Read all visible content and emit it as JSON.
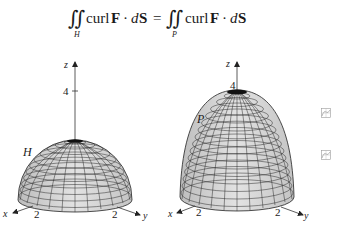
{
  "equation": {
    "lhs_integral": "∬",
    "lhs_subscript": "H",
    "lhs_curl": "curl",
    "lhs_F": "F",
    "lhs_dot": "·",
    "lhs_d": "d",
    "lhs_S": "S",
    "equals": "=",
    "rhs_integral": "∬",
    "rhs_subscript": "P",
    "rhs_curl": "curl",
    "rhs_F": "F",
    "rhs_dot": "·",
    "rhs_d": "d",
    "rhs_S": "S"
  },
  "figures": [
    {
      "surface": "hemisphere",
      "label": "H",
      "z_axis_label": "z",
      "z_tick": "4",
      "x_axis_label": "x",
      "x_tick": "2",
      "y_axis_label": "y",
      "y_tick": "2"
    },
    {
      "surface": "paraboloid",
      "label": "P",
      "z_axis_label": "z",
      "z_tick": "4",
      "x_axis_label": "x",
      "x_tick": "2",
      "y_axis_label": "y",
      "y_tick": "2"
    }
  ],
  "side_icons": [
    "graph-icon",
    "graph-icon"
  ],
  "colors": {
    "surface_fill": "#d4d4d4",
    "mesh_line": "#2a2a2a",
    "axis": "#333333",
    "icon_stroke": "#9a9a9a"
  }
}
